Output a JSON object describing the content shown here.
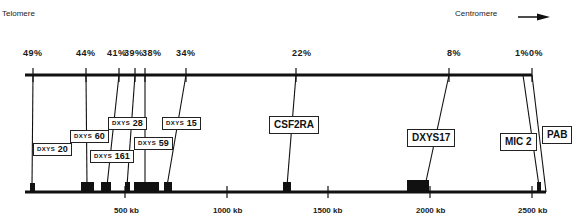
{
  "header": {
    "left_label": "Telomere",
    "right_label": "Centromere",
    "arrow_icon": "right-arrow-icon"
  },
  "percentages": [
    {
      "label": "49%",
      "x": 33
    },
    {
      "label": "44%",
      "x": 85
    },
    {
      "label": "41%",
      "x": 117
    },
    {
      "label": "39%",
      "x": 135
    },
    {
      "label": "38%",
      "x": 145
    },
    {
      "label": "34%",
      "x": 186
    },
    {
      "label": "22%",
      "x": 297
    },
    {
      "label": "8%",
      "x": 450
    },
    {
      "label": "1%",
      "x": 523
    },
    {
      "label": "0%",
      "x": 533
    }
  ],
  "markers": [
    {
      "prefix": "DXYS",
      "num": "20",
      "full": "DXYS 20"
    },
    {
      "prefix": "DXYS",
      "num": "60",
      "full": "DXYS 60"
    },
    {
      "prefix": "DXYS",
      "num": "161",
      "full": "DXYS 161"
    },
    {
      "prefix": "DXYS",
      "num": "28",
      "full": "DXYS 28"
    },
    {
      "prefix": "DXYS",
      "num": "59",
      "full": "DXYS 59"
    },
    {
      "prefix": "DXYS",
      "num": "15",
      "full": "DXYS 15"
    },
    {
      "label": "CSF2RA"
    },
    {
      "label": "DXYS17"
    },
    {
      "label": "MIC 2"
    },
    {
      "label": "PAB"
    }
  ],
  "axis": {
    "ticks": [
      "500 kb",
      "1000 kb",
      "1500 kb",
      "2000 kb",
      "2500 kb"
    ]
  },
  "colors": {
    "ink": "#111111",
    "background": "#ffffff"
  }
}
